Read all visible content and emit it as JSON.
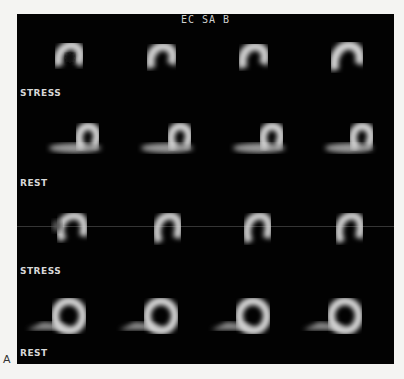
{
  "figure": {
    "panel_label": "A",
    "title": "EC SA B"
  },
  "rows": [
    {
      "label": "STRESS",
      "type": "stress",
      "slices": 4
    },
    {
      "label": "REST",
      "type": "rest",
      "slices": 4
    },
    {
      "label": "STRESS",
      "type": "stress",
      "slices": 4
    },
    {
      "label": "REST",
      "type": "rest",
      "slices": 4
    }
  ],
  "colors": {
    "background": "#020202",
    "page": "#f4f4f2",
    "text": "#d8d8d8"
  }
}
